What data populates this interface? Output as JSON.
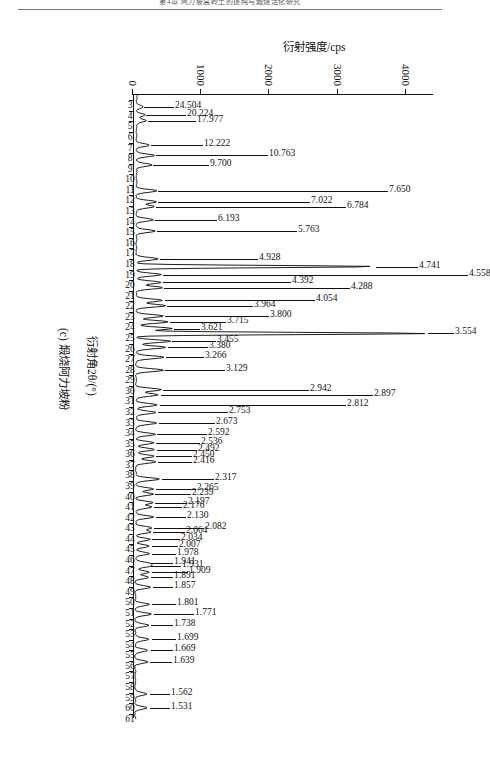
{
  "header": {
    "running_head": "第4章 阿力坡高岭土的提纯与煅烧活化研究"
  },
  "figure": {
    "caption": "(c) 煅烧阿力坡粉",
    "x_axis_title": "衍射角2θ/(°)",
    "y_axis_title": "衍射强度/cps"
  },
  "chart_data": {
    "type": "line",
    "title": "(c) 煅烧阿力坡粉",
    "xlabel": "衍射角2θ/(°)",
    "ylabel": "衍射强度/cps",
    "xlim": [
      2.5,
      61.5
    ],
    "ylim": [
      0,
      4400
    ],
    "grid": false,
    "legend": null,
    "orientation": "page-rotated-90deg",
    "y_ticks": [
      0,
      1000,
      2000,
      3000,
      4000
    ],
    "y_tick_labels": [
      "0",
      "1000",
      "2000",
      "3000",
      "4000"
    ],
    "x_ticks": [
      3,
      4,
      5,
      6,
      7,
      8,
      9,
      10,
      11,
      12,
      13,
      14,
      15,
      16,
      17,
      18,
      19,
      20,
      21,
      22,
      23,
      24,
      25,
      26,
      27,
      28,
      29,
      30,
      31,
      32,
      33,
      34,
      35,
      36,
      37,
      38,
      39,
      40,
      41,
      42,
      43,
      44,
      45,
      46,
      47,
      48,
      49,
      50,
      51,
      52,
      53,
      54,
      55,
      56,
      57,
      58,
      59,
      60,
      61
    ],
    "x_tick_labels": [
      "3",
      "4",
      "5",
      "6",
      "7",
      "8",
      "9",
      "10",
      "11",
      "12",
      "13",
      "14",
      "15",
      "16",
      "17",
      "18",
      "19",
      "20",
      "21",
      "22",
      "23",
      "24",
      "25",
      "26",
      "27",
      "28",
      "29",
      "30",
      "31",
      "32",
      "33",
      "34",
      "35",
      "36",
      "37",
      "38",
      "39",
      "40",
      "41",
      "42",
      "43",
      "44",
      "45",
      "46",
      "47",
      "48",
      "49",
      "50",
      "51",
      "52",
      "53",
      "54",
      "55",
      "56",
      "57",
      "58",
      "59",
      "60",
      "61"
    ],
    "annotation_note": "Labels are d-spacing values (Å) printed above each diffraction peak",
    "peaks": [
      {
        "label": "24.504",
        "two_theta": 3.62,
        "intensity": 120,
        "lead": 30
      },
      {
        "label": "20.224",
        "two_theta": 4.38,
        "intensity": 150,
        "lead": 40
      },
      {
        "label": "17.977",
        "two_theta": 4.92,
        "intensity": 175,
        "lead": 48
      },
      {
        "label": "12.222",
        "two_theta": 7.24,
        "intensity": 215,
        "lead": 52
      },
      {
        "label": "10.763",
        "two_theta": 8.22,
        "intensity": 290,
        "lead": 112
      },
      {
        "label": "9.700",
        "two_theta": 9.12,
        "intensity": 255,
        "lead": 56
      },
      {
        "label": "7.650",
        "two_theta": 11.56,
        "intensity": 330,
        "lead": 230
      },
      {
        "label": "7.022",
        "two_theta": 12.6,
        "intensity": 320,
        "lead": 152
      },
      {
        "label": "6.784",
        "two_theta": 13.05,
        "intensity": 300,
        "lead": 190
      },
      {
        "label": "6.193",
        "two_theta": 14.3,
        "intensity": 275,
        "lead": 62
      },
      {
        "label": "5.763",
        "two_theta": 15.37,
        "intensity": 305,
        "lead": 140
      },
      {
        "label": "4.928",
        "two_theta": 18.0,
        "intensity": 350,
        "lead": 98
      },
      {
        "label": "4.741",
        "two_theta": 18.72,
        "intensity": 3520,
        "lead": 42
      },
      {
        "label": "4.558",
        "two_theta": 19.48,
        "intensity": 395,
        "lead": 305
      },
      {
        "label": "4.392",
        "two_theta": 20.22,
        "intensity": 400,
        "lead": 128
      },
      {
        "label": "4.288",
        "two_theta": 20.72,
        "intensity": 415,
        "lead": 186
      },
      {
        "label": "4.054",
        "two_theta": 21.92,
        "intensity": 420,
        "lead": 150
      },
      {
        "label": "3.964",
        "two_theta": 22.42,
        "intensity": 455,
        "lead": 86
      },
      {
        "label": "3.800",
        "two_theta": 23.4,
        "intensity": 430,
        "lead": 104
      },
      {
        "label": "3.715",
        "two_theta": 23.95,
        "intensity": 500,
        "lead": 56
      },
      {
        "label": "3.621",
        "two_theta": 24.58,
        "intensity": 560,
        "lead": 26
      },
      {
        "label": "3.554",
        "two_theta": 25.05,
        "intensity": 4280,
        "lead": 26
      },
      {
        "label": "3.455",
        "two_theta": 25.78,
        "intensity": 530,
        "lead": 44
      },
      {
        "label": "3.380",
        "two_theta": 26.36,
        "intensity": 470,
        "lead": 40
      },
      {
        "label": "3.266",
        "two_theta": 27.3,
        "intensity": 445,
        "lead": 38
      },
      {
        "label": "3.129",
        "two_theta": 28.52,
        "intensity": 430,
        "lead": 60
      },
      {
        "label": "2.942",
        "two_theta": 30.36,
        "intensity": 400,
        "lead": 146
      },
      {
        "label": "2.897",
        "two_theta": 30.85,
        "intensity": 360,
        "lead": 212
      },
      {
        "label": "2.812",
        "two_theta": 31.8,
        "intensity": 345,
        "lead": 186
      },
      {
        "label": "2.753",
        "two_theta": 32.52,
        "intensity": 330,
        "lead": 70
      },
      {
        "label": "2.673",
        "two_theta": 33.52,
        "intensity": 340,
        "lead": 56
      },
      {
        "label": "2.592",
        "two_theta": 34.58,
        "intensity": 315,
        "lead": 50
      },
      {
        "label": "2.536",
        "two_theta": 35.38,
        "intensity": 300,
        "lead": 44
      },
      {
        "label": "2.492",
        "two_theta": 36.02,
        "intensity": 305,
        "lead": 40
      },
      {
        "label": "2.450",
        "two_theta": 36.66,
        "intensity": 300,
        "lead": 36
      },
      {
        "label": "2.416",
        "two_theta": 37.18,
        "intensity": 330,
        "lead": 34
      },
      {
        "label": "2.317",
        "two_theta": 38.82,
        "intensity": 385,
        "lead": 52
      },
      {
        "label": "2.265",
        "two_theta": 39.75,
        "intensity": 300,
        "lead": 40
      },
      {
        "label": "2.239",
        "two_theta": 40.24,
        "intensity": 285,
        "lead": 36
      },
      {
        "label": "2.197",
        "two_theta": 41.04,
        "intensity": 280,
        "lead": 32
      },
      {
        "label": "2.176",
        "two_theta": 41.46,
        "intensity": 270,
        "lead": 28
      },
      {
        "label": "2.130",
        "two_theta": 42.4,
        "intensity": 300,
        "lead": 30
      },
      {
        "label": "2.082",
        "two_theta": 43.42,
        "intensity": 270,
        "lead": 50
      },
      {
        "label": "2.064",
        "two_theta": 43.82,
        "intensity": 250,
        "lead": 32
      },
      {
        "label": "2.034",
        "two_theta": 44.52,
        "intensity": 240,
        "lead": 28
      },
      {
        "label": "2.007",
        "two_theta": 45.15,
        "intensity": 235,
        "lead": 26
      },
      {
        "label": "1.978",
        "two_theta": 45.86,
        "intensity": 240,
        "lead": 24
      },
      {
        "label": "1.941",
        "two_theta": 46.78,
        "intensity": 225,
        "lead": 22
      },
      {
        "label": "1.931",
        "two_theta": 47.04,
        "intensity": 225,
        "lead": 30
      },
      {
        "label": "1.909",
        "two_theta": 47.62,
        "intensity": 235,
        "lead": 36
      },
      {
        "label": "1.891",
        "two_theta": 48.1,
        "intensity": 220,
        "lead": 22
      },
      {
        "label": "1.857",
        "two_theta": 49.04,
        "intensity": 250,
        "lead": 20
      },
      {
        "label": "1.801",
        "two_theta": 50.66,
        "intensity": 230,
        "lead": 24
      },
      {
        "label": "1.771",
        "two_theta": 51.58,
        "intensity": 260,
        "lead": 40
      },
      {
        "label": "1.738",
        "two_theta": 52.64,
        "intensity": 225,
        "lead": 22
      },
      {
        "label": "1.699",
        "two_theta": 53.96,
        "intensity": 235,
        "lead": 24
      },
      {
        "label": "1.669",
        "two_theta": 55.0,
        "intensity": 215,
        "lead": 22
      },
      {
        "label": "1.639",
        "two_theta": 56.1,
        "intensity": 210,
        "lead": 22
      },
      {
        "label": "1.562",
        "two_theta": 59.14,
        "intensity": 205,
        "lead": 20
      },
      {
        "label": "1.531",
        "two_theta": 60.44,
        "intensity": 200,
        "lead": 20
      }
    ]
  }
}
